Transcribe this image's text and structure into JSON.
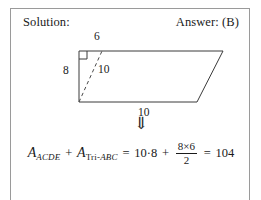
{
  "card": {
    "border_color": "#9a9a9a",
    "background": "#ffffff"
  },
  "header": {
    "solution_label": "Solution:",
    "answer_label": "Answer: (B)"
  },
  "figure": {
    "stroke_color": "#3a3a3a",
    "labels": {
      "top": "6",
      "left": "8",
      "diagonal": "10",
      "bottom": "10"
    },
    "vertices": {
      "top_left": [
        78,
        42
      ],
      "top_right": [
        222,
        42
      ],
      "bottom_right": [
        196,
        93
      ],
      "bottom_left": [
        78,
        93
      ]
    },
    "dashed_segment": {
      "from": [
        78,
        93
      ],
      "to": [
        101,
        42
      ],
      "length_label": "10"
    },
    "right_angle_marker": {
      "at": "top_left",
      "size": 8
    }
  },
  "arrow": {
    "glyph": "⇓"
  },
  "equation": {
    "term1_var": "A",
    "term1_sub": "ACDE",
    "plus": "+",
    "term2_var": "A",
    "term2_sub_upright": "Tri-",
    "term2_sub_italic": "ABC",
    "equals1": "=",
    "product": "10·8",
    "plus2": "+",
    "fraction_numerator": "8×6",
    "fraction_denominator": "2",
    "equals2": "=",
    "result": "104"
  }
}
